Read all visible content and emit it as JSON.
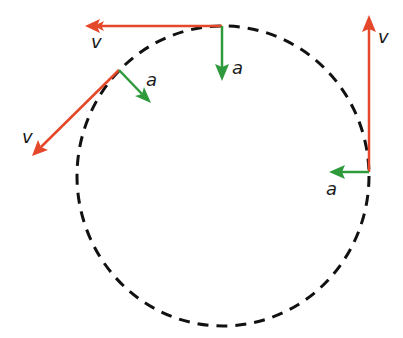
{
  "diagram": {
    "colors": {
      "velocity": "#e5472b",
      "acceleration": "#2f9a3c",
      "path": "#111111",
      "label": "#1a1a1a"
    },
    "path": {
      "shape": "circle",
      "style": "dashed",
      "center": [
        223,
        176
      ],
      "rx": 146,
      "ry": 150
    },
    "points": [
      {
        "name": "top",
        "at": [
          222,
          26
        ],
        "velocity": {
          "label": "v",
          "to": [
            85,
            26
          ],
          "label_pos": [
            91,
            48
          ]
        },
        "acceleration": {
          "label": "a",
          "to": [
            222,
            80
          ],
          "label_pos": [
            232,
            74
          ]
        }
      },
      {
        "name": "upper-left",
        "at": [
          119,
          70
        ],
        "velocity": {
          "label": "v",
          "to": [
            32,
            155
          ],
          "label_pos": [
            22,
            142
          ]
        },
        "acceleration": {
          "label": "a",
          "to": [
            150,
            102
          ],
          "label_pos": [
            146,
            86
          ]
        }
      },
      {
        "name": "right",
        "at": [
          369,
          172
        ],
        "velocity": {
          "label": "v",
          "to": [
            369,
            15
          ],
          "label_pos": [
            378,
            42
          ]
        },
        "acceleration": {
          "label": "a",
          "to": [
            330,
            172
          ],
          "label_pos": [
            326,
            194
          ]
        }
      }
    ]
  }
}
